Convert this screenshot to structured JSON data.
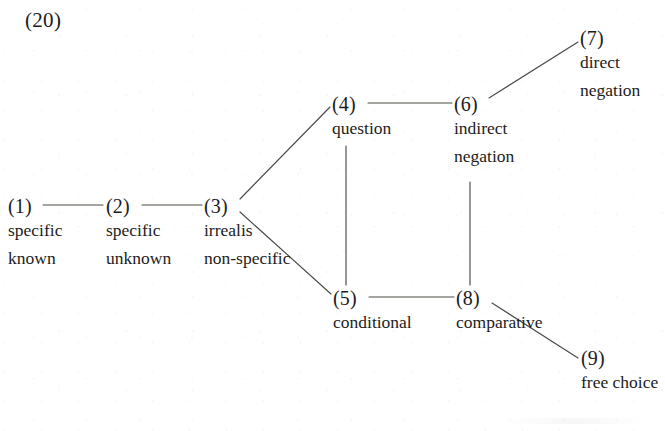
{
  "page": {
    "example_number": "(20)",
    "background_color": "#ffffff",
    "ink_color": "#1c1c1c",
    "line_color": "#4a4a44"
  },
  "diagram": {
    "type": "semantic-map",
    "nodes": [
      {
        "id": "(1)",
        "lines": [
          "specific",
          "known"
        ],
        "x": 8,
        "y": 196
      },
      {
        "id": "(2)",
        "lines": [
          "specific",
          "unknown"
        ],
        "x": 106,
        "y": 196
      },
      {
        "id": "(3)",
        "lines": [
          "irrealis",
          "non-specific"
        ],
        "x": 204,
        "y": 196
      },
      {
        "id": "(4)",
        "lines": [
          "question"
        ],
        "x": 332,
        "y": 94
      },
      {
        "id": "(5)",
        "lines": [
          "conditional"
        ],
        "x": 333,
        "y": 288
      },
      {
        "id": "(6)",
        "lines": [
          "indirect",
          "negation"
        ],
        "x": 454,
        "y": 94
      },
      {
        "id": "(7)",
        "lines": [
          "direct",
          "negation"
        ],
        "x": 580,
        "y": 28
      },
      {
        "id": "(8)",
        "lines": [
          "comparative"
        ],
        "x": 456,
        "y": 288
      },
      {
        "id": "(9)",
        "lines": [
          "free choice"
        ],
        "x": 581,
        "y": 348
      }
    ],
    "edges": [
      {
        "from": "(1)",
        "to": "(2)",
        "x1": 43,
        "y1": 205,
        "x2": 103,
        "y2": 205
      },
      {
        "from": "(2)",
        "to": "(3)",
        "x1": 142,
        "y1": 205,
        "x2": 202,
        "y2": 205
      },
      {
        "from": "(3)",
        "to": "(4)",
        "x1": 240,
        "y1": 199,
        "x2": 330,
        "y2": 107
      },
      {
        "from": "(3)",
        "to": "(5)",
        "x1": 240,
        "y1": 212,
        "x2": 331,
        "y2": 294
      },
      {
        "from": "(4)",
        "to": "(6)",
        "x1": 368,
        "y1": 103,
        "x2": 452,
        "y2": 103
      },
      {
        "from": "(4)",
        "to": "(5)",
        "x1": 346,
        "y1": 146,
        "x2": 346,
        "y2": 285
      },
      {
        "from": "(6)",
        "to": "(7)",
        "x1": 489,
        "y1": 98,
        "x2": 578,
        "y2": 42
      },
      {
        "from": "(6)",
        "to": "(8)",
        "x1": 470,
        "y1": 182,
        "x2": 470,
        "y2": 285
      },
      {
        "from": "(5)",
        "to": "(8)",
        "x1": 369,
        "y1": 297,
        "x2": 454,
        "y2": 297
      },
      {
        "from": "(8)",
        "to": "(9)",
        "x1": 492,
        "y1": 303,
        "x2": 578,
        "y2": 358
      }
    ]
  }
}
